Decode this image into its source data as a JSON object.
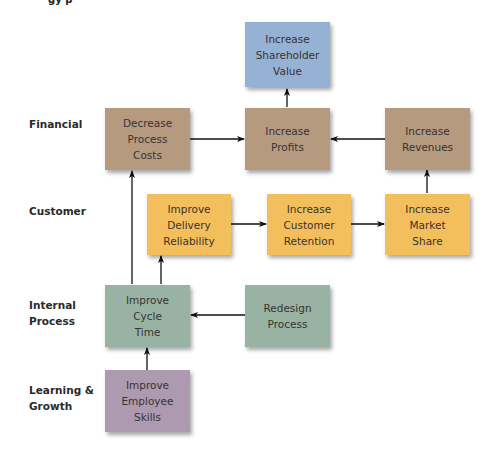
{
  "title_fragment": "gy  p",
  "colors": {
    "financial": "#b59a80",
    "shareholder": "#95b1d4",
    "customer": "#f2bf5c",
    "internal": "#98b3a3",
    "learning": "#ad9ab0",
    "arrow": "#111111"
  },
  "rows": [
    {
      "id": "financial",
      "label_lines": [
        "Financial"
      ]
    },
    {
      "id": "customer",
      "label_lines": [
        "Customer"
      ]
    },
    {
      "id": "internal",
      "label_lines": [
        "Internal",
        "Process"
      ]
    },
    {
      "id": "learning",
      "label_lines": [
        "Learning &",
        "Growth"
      ]
    }
  ],
  "nodes": {
    "shareholder_value": {
      "lines": [
        "Increase",
        "Shareholder",
        "Value"
      ]
    },
    "decrease_costs": {
      "lines": [
        "Decrease",
        "Process",
        "Costs"
      ]
    },
    "increase_profits": {
      "lines": [
        "Increase",
        "Profits"
      ]
    },
    "increase_revenues": {
      "lines": [
        "Increase",
        "Revenues"
      ]
    },
    "delivery_reliability": {
      "lines": [
        "Improve",
        "Delivery",
        "Reliability"
      ]
    },
    "customer_retention": {
      "lines": [
        "Increase",
        "Customer",
        "Retention"
      ]
    },
    "market_share": {
      "lines": [
        "Increase",
        "Market",
        "Share"
      ]
    },
    "cycle_time": {
      "lines": [
        "Improve",
        "Cycle",
        "Time"
      ]
    },
    "redesign_process": {
      "lines": [
        "Redesign",
        "Process"
      ]
    },
    "employee_skills": {
      "lines": [
        "Improve",
        "Employee",
        "Skills"
      ]
    }
  },
  "edges": [
    {
      "from": "increase_profits",
      "to": "shareholder_value"
    },
    {
      "from": "decrease_costs",
      "to": "increase_profits"
    },
    {
      "from": "increase_revenues",
      "to": "increase_profits"
    },
    {
      "from": "market_share",
      "to": "increase_revenues"
    },
    {
      "from": "delivery_reliability",
      "to": "customer_retention"
    },
    {
      "from": "customer_retention",
      "to": "market_share"
    },
    {
      "from": "cycle_time",
      "to": "decrease_costs"
    },
    {
      "from": "cycle_time",
      "to": "delivery_reliability"
    },
    {
      "from": "redesign_process",
      "to": "cycle_time"
    },
    {
      "from": "employee_skills",
      "to": "cycle_time"
    }
  ]
}
